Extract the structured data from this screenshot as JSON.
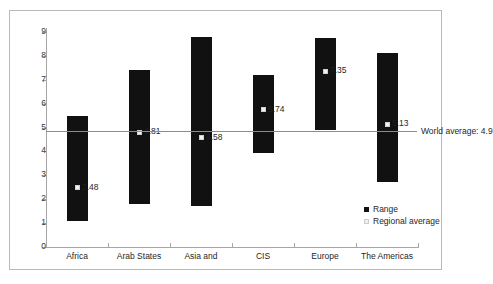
{
  "chart_data": {
    "type": "bar",
    "title": "",
    "subtitle": "",
    "xlabel": "",
    "ylabel": "",
    "ylim": [
      0,
      9.4
    ],
    "yticks": [
      0,
      1,
      2,
      3,
      4,
      5,
      6,
      7,
      8,
      9
    ],
    "grid": false,
    "legend_position": "bottom-right",
    "categories": [
      "Africa",
      "Arab States",
      "Asia and",
      "CIS",
      "Europe",
      "The Americas"
    ],
    "series": [
      {
        "name": "Range",
        "type": "range-bar",
        "low": [
          1.1,
          1.78,
          1.7,
          3.95,
          4.9,
          2.72
        ],
        "high": [
          5.5,
          7.42,
          8.8,
          7.18,
          8.75,
          8.12
        ]
      },
      {
        "name": "Regional average",
        "type": "marker",
        "values": [
          2.48,
          4.81,
          4.58,
          5.74,
          7.35,
          5.13
        ],
        "labels": [
          "2.48",
          "4.81",
          "4.58",
          "5.74",
          "7.35",
          "5.13"
        ]
      }
    ],
    "reference_line": {
      "label": "World average: 4.9",
      "value": 4.9
    },
    "legend": [
      {
        "label": "Range",
        "marker": "filled-square",
        "color": "#111111"
      },
      {
        "label": "Regional average",
        "marker": "light-square",
        "color": "#efefef"
      }
    ],
    "colors": {
      "bar": "#111111",
      "marker": "#f2f2f2",
      "axis": "#a6a6a6",
      "reference_line": "#8c8c8c",
      "text": "#1f1f1f",
      "frame": "#b9b9b9",
      "background": "#ffffff"
    }
  }
}
